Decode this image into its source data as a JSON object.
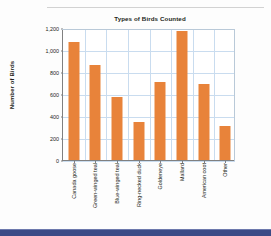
{
  "page": {
    "background_color": "#fdfdfd",
    "top_rule_color": "#d2d2d2",
    "bottom_band_color": "#3b4a86"
  },
  "chart_data": {
    "type": "bar",
    "title": "Types of Birds Counted",
    "xlabel": "",
    "ylabel": "Number of Birds",
    "categories": [
      "Canada goose",
      "Green-winged teal",
      "Blue-winged teal",
      "Ring-necked duck",
      "Goldeneye",
      "Mallard",
      "American coot",
      "Other"
    ],
    "values": [
      1070,
      860,
      570,
      345,
      705,
      1170,
      690,
      310
    ],
    "ylim": [
      0,
      1200
    ],
    "ytick_values": [
      0,
      200,
      400,
      600,
      800,
      1000,
      1200
    ],
    "ytick_labels": [
      "0",
      "200",
      "400",
      "600",
      "800",
      "1,000",
      "1,200"
    ],
    "grid": true,
    "legend": false,
    "bar_color": "#e8833a",
    "grid_color": "#c9dcef",
    "axis_color": "#808080",
    "text_color": "#231f20"
  }
}
